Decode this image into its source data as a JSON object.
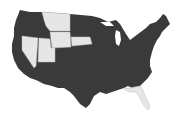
{
  "map": {
    "title": "",
    "region": "United States (contiguous)",
    "colors": {
      "default_state": "#3a3a3a",
      "highlighted_state": "#e6e6e6",
      "background": "#ffffff",
      "border": "#bdbdbd"
    },
    "highlighted_states": [
      "Montana",
      "Wyoming",
      "Nevada",
      "Utah",
      "Nebraska",
      "Florida"
    ]
  }
}
